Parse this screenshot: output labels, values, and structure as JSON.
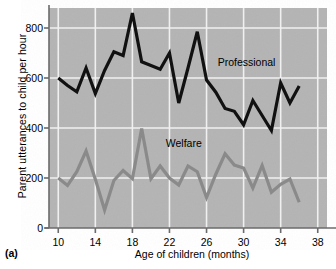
{
  "figure": {
    "panel_tag": "(a)",
    "background_color": "#ffffff",
    "plot_background_color": "#b4b4b4",
    "grid_color": "#f0f0f0",
    "axis_color": "#6b6b6b"
  },
  "chart_data": {
    "type": "line",
    "title": "",
    "xlabel": "Age of children (months)",
    "ylabel": "Parent utterances to child per hour",
    "xlim": [
      9,
      39
    ],
    "ylim": [
      0,
      880
    ],
    "xticks": [
      10,
      14,
      18,
      22,
      26,
      30,
      34,
      38
    ],
    "xtick_labels": [
      "10",
      "14",
      "18",
      "22",
      "26",
      "30",
      "34",
      "38"
    ],
    "yticks": [
      0,
      200,
      400,
      600,
      800
    ],
    "ytick_labels": [
      "0",
      "200",
      "400",
      "600",
      "800"
    ],
    "grid": "both",
    "legend_position": "inline-annotation",
    "x": [
      10,
      11,
      12,
      13,
      14,
      15,
      16,
      17,
      18,
      19,
      20,
      21,
      22,
      23,
      24,
      25,
      26,
      27,
      28,
      29,
      30,
      31,
      32,
      33,
      34,
      35,
      36
    ],
    "series": [
      {
        "name": "Professional",
        "color": "#111111",
        "line_width": 3.2,
        "label_x": 27.2,
        "label_y": 660,
        "values": [
          600,
          570,
          545,
          640,
          538,
          630,
          705,
          690,
          860,
          665,
          650,
          635,
          700,
          500,
          640,
          785,
          592,
          543,
          478,
          467,
          413,
          510,
          450,
          390,
          580,
          500,
          568
        ]
      },
      {
        "name": "Welfare",
        "color": "#8a8a8a",
        "line_width": 3.2,
        "label_x": 21.6,
        "label_y": 335,
        "values": [
          200,
          170,
          225,
          308,
          195,
          72,
          190,
          230,
          197,
          398,
          197,
          248,
          200,
          172,
          248,
          225,
          122,
          215,
          297,
          252,
          240,
          160,
          250,
          143,
          175,
          196,
          103
        ]
      }
    ]
  }
}
